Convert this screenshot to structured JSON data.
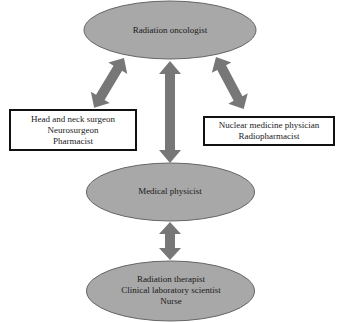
{
  "diagram": {
    "colors": {
      "ellipse_fill": "#a8a8a8",
      "ellipse_stroke": "#666666",
      "arrow": "#777777",
      "box_border": "#111111",
      "background": "#ffffff"
    },
    "nodes": {
      "top": {
        "shape": "ellipse",
        "lines": [
          "Radiation oncologist"
        ]
      },
      "left_box": {
        "shape": "rectangle",
        "lines": [
          "Head and neck surgeon",
          "Neurosurgeon",
          "Pharmacist"
        ]
      },
      "right_box": {
        "shape": "rectangle",
        "lines": [
          "Nuclear medicine physician",
          "Radiopharmacist"
        ]
      },
      "middle": {
        "shape": "ellipse",
        "lines": [
          "Medical physicist"
        ]
      },
      "bottom": {
        "shape": "ellipse",
        "lines": [
          "Radiation therapist",
          "Clinical laboratory scientist",
          "Nurse"
        ]
      }
    },
    "edges": [
      {
        "from": "top",
        "to": "left_box",
        "type": "bidirectional"
      },
      {
        "from": "top",
        "to": "middle",
        "type": "bidirectional"
      },
      {
        "from": "top",
        "to": "right_box",
        "type": "bidirectional"
      },
      {
        "from": "middle",
        "to": "bottom",
        "type": "bidirectional"
      }
    ]
  }
}
